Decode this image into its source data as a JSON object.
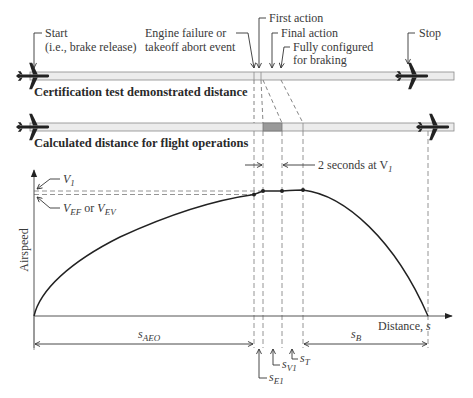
{
  "figure": {
    "top_bar": {
      "label": "Certification test demonstrated distance"
    },
    "bottom_bar": {
      "label": "Calculated distance for flight operations"
    },
    "callouts": {
      "start_line1": "Start",
      "start_line2": "(i.e., brake release)",
      "engine_failure_line1": "Engine failure or",
      "engine_failure_line2": "takeoff abort event",
      "first_action": "First action",
      "final_action": "Final action",
      "fully_configured_line1": "Fully configured",
      "fully_configured_line2": "for braking",
      "stop": "Stop",
      "two_seconds": "2 seconds at V",
      "two_seconds_sub": "1"
    },
    "chart": {
      "ylabel": "Airspeed",
      "xlabel": "Distance, ",
      "xlabel_var": "s",
      "v1": "V",
      "v1_sub": "1",
      "vef": "V",
      "vef_sub": "EF",
      "or": " or ",
      "vev": "V",
      "vev_sub": "EV",
      "s_aeo": "s",
      "s_aeo_sub": "AEO",
      "s_e1": "s",
      "s_e1_sub": "E1",
      "s_v1": "s",
      "s_v1_sub": "V1",
      "s_t": "s",
      "s_t_sub": "T",
      "s_b": "s",
      "s_b_sub": "B"
    },
    "colors": {
      "bar_fill": "#ececec",
      "bar_stroke": "#8a8a8a",
      "highlight": "#9a9a9a",
      "curve": "#222222",
      "dash": "#777777"
    }
  }
}
